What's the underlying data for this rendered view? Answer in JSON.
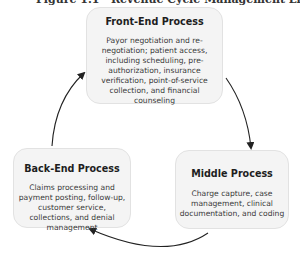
{
  "caption": "Figure 1.1 · Revenue Cycle Management Life Cycle",
  "diagram": {
    "type": "cycle",
    "nodes": [
      {
        "id": "front",
        "title": "Front-End Process",
        "body": "Payor negotiation and re-negotiation; patient access, including scheduling, pre-authorization, insurance verification, point-of-service collection, and financial counseling"
      },
      {
        "id": "middle",
        "title": "Middle Process",
        "body": "Charge capture, case management, clinical documentation, and coding"
      },
      {
        "id": "back",
        "title": "Back-End Process",
        "body": "Claims processing and payment posting, follow-up, customer service, collections, and denial management"
      }
    ],
    "edges": [
      {
        "from": "front",
        "to": "middle"
      },
      {
        "from": "middle",
        "to": "back"
      },
      {
        "from": "back",
        "to": "front"
      }
    ],
    "colors": {
      "box_fill": "#f4f4f4",
      "box_border": "#e2e2e2",
      "arrow": "#222222"
    }
  }
}
